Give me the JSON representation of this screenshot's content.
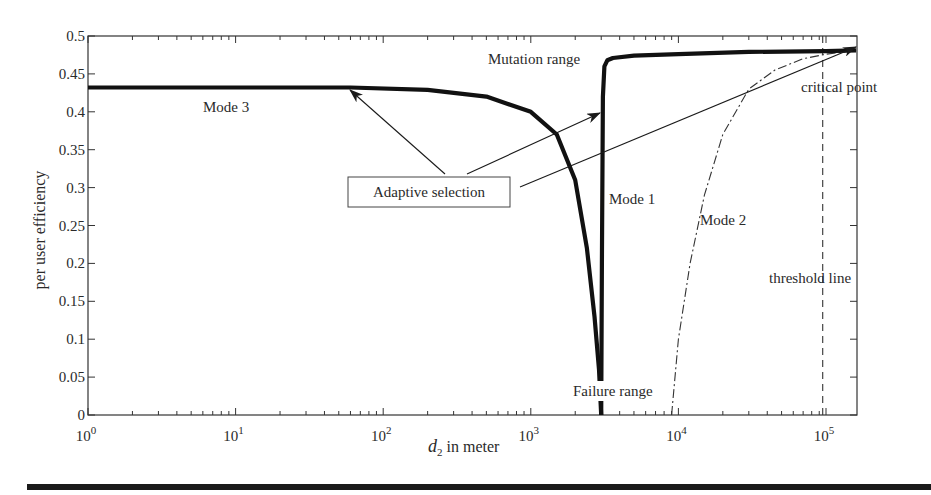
{
  "chart_data": {
    "type": "line",
    "title": "",
    "xlabel": "d2 in meter",
    "xlabel_main": "d",
    "xlabel_sub": "2",
    "xlabel_rest": " in meter",
    "ylabel": "per user efficiency",
    "xscale": "log",
    "xlim": [
      1,
      160000
    ],
    "ylim": [
      0,
      0.5
    ],
    "grid": false,
    "legend": null,
    "x_ticks": [
      {
        "base": "10",
        "exp": "0",
        "value": 1
      },
      {
        "base": "10",
        "exp": "1",
        "value": 10
      },
      {
        "base": "10",
        "exp": "2",
        "value": 100
      },
      {
        "base": "10",
        "exp": "3",
        "value": 1000
      },
      {
        "base": "10",
        "exp": "4",
        "value": 10000
      },
      {
        "base": "10",
        "exp": "5",
        "value": 100000
      }
    ],
    "y_ticks": [
      "0",
      "0.05",
      "0.1",
      "0.15",
      "0.2",
      "0.25",
      "0.3",
      "0.35",
      "0.4",
      "0.45",
      "0.5"
    ],
    "series": [
      {
        "name": "Mode 3",
        "style": "thick-solid",
        "x": [
          1,
          10,
          60,
          200,
          500,
          1000,
          1500,
          2000,
          2400,
          2700,
          2900,
          3000
        ],
        "y": [
          0.432,
          0.432,
          0.432,
          0.429,
          0.42,
          0.4,
          0.37,
          0.31,
          0.22,
          0.13,
          0.06,
          0.0
        ]
      },
      {
        "name": "Mode 1",
        "style": "thick-solid",
        "x": [
          3000,
          3030,
          3080,
          3150,
          3300,
          3600,
          5000,
          10000,
          30000,
          100000,
          160000
        ],
        "y": [
          0.0,
          0.2,
          0.42,
          0.46,
          0.468,
          0.471,
          0.474,
          0.476,
          0.479,
          0.48,
          0.481
        ]
      },
      {
        "name": "Mode 2",
        "style": "dash-dot",
        "x": [
          9000,
          10000,
          12000,
          15000,
          20000,
          30000,
          45000,
          70000,
          100000,
          160000
        ],
        "y": [
          0.0,
          0.1,
          0.2,
          0.29,
          0.37,
          0.43,
          0.455,
          0.47,
          0.476,
          0.481
        ]
      }
    ],
    "threshold_line": {
      "x": 95000,
      "label": "threshold line",
      "style": "dashed"
    },
    "annotations": [
      {
        "text": "Mode 3",
        "x": 100,
        "y": 0.41
      },
      {
        "text": "Mutation range",
        "x": 1500,
        "y": 0.47
      },
      {
        "text": "Mode 1",
        "x": 3300,
        "y": 0.32
      },
      {
        "text": "Mode 2",
        "x": 14000,
        "y": 0.305
      },
      {
        "text": "critical point",
        "x": 100000,
        "y": 0.435
      },
      {
        "text": "threshold line",
        "x": 40000,
        "y": 0.18
      },
      {
        "text": "Failure range",
        "x": 2000,
        "y": 0.0
      },
      {
        "text": "Adaptive selection",
        "boxed": true,
        "arrows_to": [
          "Mode 3 plateau",
          "Mode 1 rise",
          "critical point"
        ]
      }
    ]
  },
  "labels": {
    "mode3": "Mode 3",
    "mode1": "Mode 1",
    "mode2": "Mode 2",
    "mutation": "Mutation range",
    "critical": "critical point",
    "threshold": "threshold line",
    "failure": "Failure range",
    "adaptive": "Adaptive selection",
    "ylabel": "per user efficiency",
    "xlabel_main": "d",
    "xlabel_sub": "2",
    "xlabel_rest": " in meter"
  },
  "colors": {
    "ink": "#1a1a1a",
    "background": "#ffffff"
  }
}
